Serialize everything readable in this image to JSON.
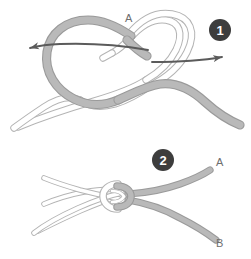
{
  "figure": {
    "width": 251,
    "height": 259,
    "background_color": "#ffffff"
  },
  "palette": {
    "rope_gray_fill": "#b9b9b9",
    "rope_gray_stroke": "#9a9a9a",
    "rope_white_fill": "#ffffff",
    "rope_white_stroke": "#b4b4b4",
    "arrow_color": "#5b5b5b",
    "badge_fill": "#3d3d3d",
    "badge_text_color": "#ffffff",
    "label_color": "#6e6e6e"
  },
  "steps": [
    {
      "id": "step-1",
      "badge": "1",
      "badge_position": {
        "cx": 220,
        "cy": 30,
        "r": 11
      },
      "description": "Two loops are formed and crossed; arrows indicate pulling both standing ends outward in opposite directions.",
      "labels": [
        {
          "name": "crossing-point-label",
          "text": "A",
          "x": 125,
          "y": 22
        }
      ],
      "arrows": [
        {
          "name": "pull-left-arrow",
          "direction": "left",
          "from_x": 148,
          "to_x": 22,
          "y": 48
        },
        {
          "name": "pull-right-arrow",
          "direction": "right",
          "from_x": 150,
          "to_x": 234,
          "y": 58
        }
      ]
    },
    {
      "id": "step-2",
      "badge": "2",
      "badge_position": {
        "cx": 163,
        "cy": 160,
        "r": 11
      },
      "description": "The knot is drawn tight; the gray rope ends A and B emerge to the right while the white rope ends exit to the left.",
      "labels": [
        {
          "name": "rope-end-a-label",
          "text": "A",
          "x": 216,
          "y": 166
        },
        {
          "name": "rope-end-b-label",
          "text": "B",
          "x": 216,
          "y": 247
        }
      ]
    }
  ],
  "divider": {
    "name": "step-divider",
    "visible": false
  }
}
